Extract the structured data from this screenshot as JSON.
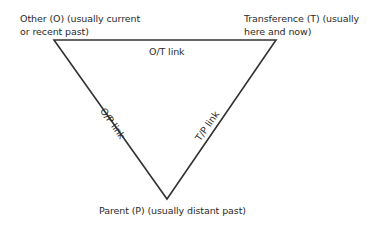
{
  "diagram": {
    "nodes": [
      {
        "id": "O",
        "label": "Other (O) (usually current\nor recent past)"
      },
      {
        "id": "T",
        "label": "Transference (T) (usually\nhere and now)"
      },
      {
        "id": "P",
        "label": "Parent (P) (usually distant past)"
      }
    ],
    "edges": [
      {
        "from": "O",
        "to": "T",
        "label": "O/T link"
      },
      {
        "from": "O",
        "to": "P",
        "label": "O/P link"
      },
      {
        "from": "T",
        "to": "P",
        "label": "T/P link"
      }
    ],
    "line_color": "#333333"
  }
}
